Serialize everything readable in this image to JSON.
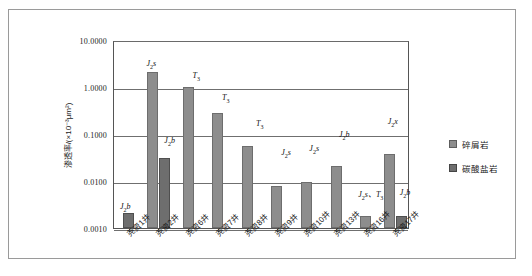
{
  "chart_data": {
    "type": "bar",
    "title": "",
    "xlabel": "",
    "ylabel": "渗透率/(×10⁻³μm²)",
    "yscale": "log",
    "ylim": [
      0.001,
      10.0
    ],
    "ytick_labels": [
      "10.0000",
      "1.0000",
      "0.1000",
      "0.0100",
      "0.0010"
    ],
    "ytick_values": [
      10.0,
      1.0,
      0.1,
      0.01,
      0.001
    ],
    "grid": true,
    "legend_position": "right",
    "categories": [
      "尧资1井",
      "尧资2井",
      "尧资6井",
      "尧资7井",
      "尧资8井",
      "尧资9井",
      "尧资10井",
      "尧资13井",
      "尧资16井",
      "尧资17井"
    ],
    "series": [
      {
        "name": "碎屑岩",
        "color": "#8d8d8d",
        "values": [
          null,
          2.1,
          1.0,
          0.28,
          0.055,
          0.0078,
          0.0095,
          0.021,
          0.0018,
          0.038
        ],
        "annotations": [
          null,
          "J2s",
          "T3",
          "T3",
          "T3",
          "J2s",
          "J2s",
          "J2b",
          "J2s、T3",
          "J2x"
        ]
      },
      {
        "name": "碳酸盐岩",
        "color": "#6e6e6e",
        "values": [
          0.0021,
          0.031,
          null,
          null,
          null,
          null,
          null,
          null,
          null,
          0.0018
        ],
        "annotations": [
          "J2b",
          "J2b",
          null,
          null,
          null,
          null,
          null,
          null,
          null,
          "J2b"
        ]
      }
    ],
    "bar_annotations": [
      {
        "text_html": "J<sub>2</sub><i>b</i>",
        "x_pct": 2.0,
        "y_px": 160
      },
      {
        "text_html": "J<sub>2</sub><i>s</i>",
        "x_pct": 11.0,
        "y_px": 17
      },
      {
        "text_html": "J<sub>2</sub><i>b</i>",
        "x_pct": 17.0,
        "y_px": 94
      },
      {
        "text_html": "T<sub>3</sub>",
        "x_pct": 26.5,
        "y_px": 29
      },
      {
        "text_html": "T<sub>3</sub>",
        "x_pct": 36.5,
        "y_px": 51
      },
      {
        "text_html": "T<sub>3</sub>",
        "x_pct": 48.0,
        "y_px": 77
      },
      {
        "text_html": "J<sub>2</sub><i>s</i>",
        "x_pct": 56.5,
        "y_px": 106
      },
      {
        "text_html": "J<sub>2</sub><i>s</i>",
        "x_pct": 66.0,
        "y_px": 102
      },
      {
        "text_html": "J<sub>2</sub><i>b</i>",
        "x_pct": 76.0,
        "y_px": 88
      },
      {
        "text_html": "J<sub>2</sub><i>s</i>、T<sub>3</sub>",
        "x_pct": 82.5,
        "y_px": 146
      },
      {
        "text_html": "J<sub>2</sub><i>x</i>",
        "x_pct": 92.5,
        "y_px": 75
      },
      {
        "text_html": "J<sub>2</sub><i>b</i>",
        "x_pct": 96.5,
        "y_px": 146
      }
    ]
  },
  "legend": {
    "items": [
      {
        "label": "碎屑岩",
        "swatch": "clastic"
      },
      {
        "label": "碳酸盐岩",
        "swatch": "carbonate"
      }
    ]
  }
}
